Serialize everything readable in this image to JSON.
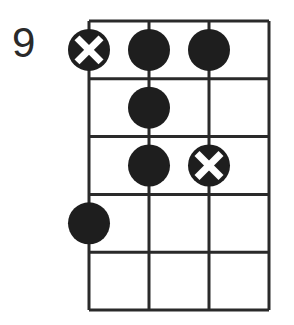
{
  "diagram": {
    "type": "fretboard-chord-diagram",
    "start_fret_label": "9",
    "strings": 4,
    "frets": 5,
    "colors": {
      "line": "#2a2a2a",
      "dot": "#1e1e1e",
      "mark": "#ffffff",
      "background": "#ffffff"
    },
    "dots": [
      {
        "fret": 1,
        "string": 1,
        "marked_x": true
      },
      {
        "fret": 1,
        "string": 2,
        "marked_x": false
      },
      {
        "fret": 1,
        "string": 3,
        "marked_x": false
      },
      {
        "fret": 2,
        "string": 2,
        "marked_x": false
      },
      {
        "fret": 3,
        "string": 2,
        "marked_x": false
      },
      {
        "fret": 3,
        "string": 3,
        "marked_x": true
      },
      {
        "fret": 4,
        "string": 1,
        "marked_x": false
      }
    ]
  }
}
